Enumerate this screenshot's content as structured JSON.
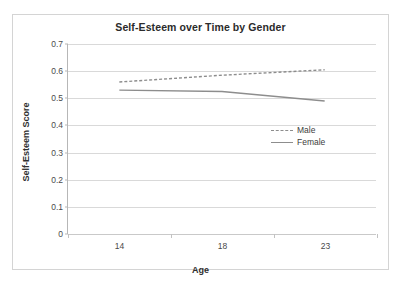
{
  "chart_data": {
    "type": "line",
    "title": "Self-Esteem over Time by Gender",
    "xlabel": "Age",
    "ylabel": "Self-Esteem Score",
    "categories": [
      "14",
      "18",
      "23"
    ],
    "series": [
      {
        "name": "Male",
        "values": [
          0.56,
          0.585,
          0.605
        ],
        "style": "dashed",
        "color": "#8d8d8d"
      },
      {
        "name": "Female",
        "values": [
          0.53,
          0.525,
          0.49
        ],
        "style": "solid",
        "color": "#8d8d8d"
      }
    ],
    "ylim": [
      0,
      0.7
    ],
    "yticks": [
      "0",
      "0.1",
      "0.2",
      "0.3",
      "0.4",
      "0.5",
      "0.6",
      "0.7"
    ],
    "ytick_values": [
      0,
      0.1,
      0.2,
      0.3,
      0.4,
      0.5,
      0.6,
      0.7
    ],
    "grid": true,
    "legend_position": "center-right",
    "background": "#ffffff",
    "gridline_color": "#d9d9d9",
    "axis_color": "#b7b7b7",
    "text_color": "#2b2b2b"
  }
}
